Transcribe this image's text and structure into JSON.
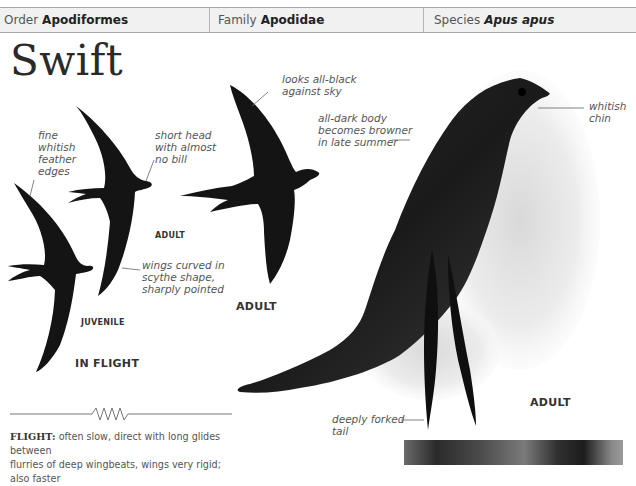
{
  "taxonomy": {
    "order": {
      "label": "Order",
      "value": "Apodiformes"
    },
    "family": {
      "label": "Family",
      "value": "Apodidae"
    },
    "species": {
      "label": "Species",
      "value": "Apus apus"
    }
  },
  "title": "Swift",
  "annotations": {
    "fine_edges": [
      "fine",
      "whitish",
      "feather",
      "edges"
    ],
    "short_head": [
      "short head",
      "with almost",
      "no bill"
    ],
    "wings_curved": [
      "wings curved in",
      "scythe shape,",
      "sharply pointed"
    ],
    "looks_black": [
      "looks all-black",
      "against sky"
    ],
    "dark_body": [
      "all-dark body",
      "becomes browner",
      "in late summer"
    ],
    "whitish_chin": [
      "whitish",
      "chin"
    ],
    "forked_tail": [
      "deeply forked",
      "tail"
    ]
  },
  "labels": {
    "adult_small": "ADULT",
    "juvenile": "JUVENILE",
    "in_flight": "IN FLIGHT",
    "adult_flight": "ADULT",
    "adult_perched": "ADULT"
  },
  "flight_text": {
    "key": "FLIGHT:",
    "line1": "often slow, direct with long glides between",
    "line2": "flurries of deep wingbeats, wings very rigid; also faster"
  },
  "colors": {
    "bird": "#141414",
    "header_bg": "#f1f1f1",
    "rule": "#a8a8a8"
  }
}
